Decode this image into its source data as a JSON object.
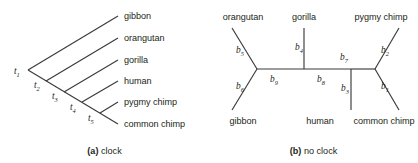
{
  "figure": {
    "background_color": "#ffffff",
    "line_color": "#3a3a3c",
    "text_color": "#231f20"
  },
  "panels": [
    {
      "id": "clock",
      "caption_letter": "(a)",
      "caption_text": "clock",
      "tree_type": "rooted-ladder",
      "tips": [
        {
          "name": "gibbon",
          "label": "gibbon"
        },
        {
          "name": "orangutan",
          "label": "orangutan"
        },
        {
          "name": "gorilla",
          "label": "gorilla"
        },
        {
          "name": "human",
          "label": "human"
        },
        {
          "name": "pygmy-chimp",
          "label": "pygmy chimp"
        },
        {
          "name": "common-chimp",
          "label": "common chimp"
        }
      ],
      "nodes": [
        {
          "name": "t1",
          "symbol": "t",
          "subscript": "1"
        },
        {
          "name": "t2",
          "symbol": "t",
          "subscript": "2"
        },
        {
          "name": "t3",
          "symbol": "t",
          "subscript": "3"
        },
        {
          "name": "t4",
          "symbol": "t",
          "subscript": "4"
        },
        {
          "name": "t5",
          "symbol": "t",
          "subscript": "5"
        }
      ]
    },
    {
      "id": "noclock",
      "caption_letter": "(b)",
      "caption_text": "no clock",
      "tree_type": "unrooted",
      "tips_top": [
        {
          "name": "orangutan",
          "label": "orangutan"
        },
        {
          "name": "gorilla",
          "label": "gorilla"
        },
        {
          "name": "pygmy-chimp",
          "label": "pygmy chimp"
        }
      ],
      "tips_bottom": [
        {
          "name": "gibbon",
          "label": "gibbon"
        },
        {
          "name": "human",
          "label": "human"
        },
        {
          "name": "common-chimp",
          "label": "common chimp"
        }
      ],
      "branches": [
        {
          "name": "b1",
          "symbol": "b",
          "subscript": "1"
        },
        {
          "name": "b2",
          "symbol": "b",
          "subscript": "2"
        },
        {
          "name": "b3",
          "symbol": "b",
          "subscript": "3"
        },
        {
          "name": "b4",
          "symbol": "b",
          "subscript": "4"
        },
        {
          "name": "b5",
          "symbol": "b",
          "subscript": "5"
        },
        {
          "name": "b6",
          "symbol": "b",
          "subscript": "6"
        },
        {
          "name": "b7",
          "symbol": "b",
          "subscript": "7"
        },
        {
          "name": "b8",
          "symbol": "b",
          "subscript": "8"
        },
        {
          "name": "b9",
          "symbol": "b",
          "subscript": "9"
        }
      ]
    }
  ]
}
